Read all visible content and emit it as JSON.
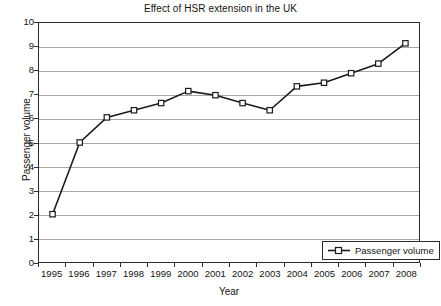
{
  "chart_data": {
    "type": "line",
    "title": "Effect of HSR extension in the UK",
    "xlabel": "Year",
    "ylabel": "Passenger volume",
    "categories": [
      "1995",
      "1996",
      "1997",
      "1998",
      "1999",
      "2000",
      "2001",
      "2002",
      "2003",
      "2004",
      "2005",
      "2006",
      "2007",
      "2008"
    ],
    "values": [
      2.0,
      5.0,
      6.05,
      6.35,
      6.65,
      7.15,
      6.98,
      6.65,
      6.35,
      7.35,
      7.5,
      7.9,
      8.3,
      9.15
    ],
    "series": [
      {
        "name": "Passenger volume",
        "values": [
          2.0,
          5.0,
          6.05,
          6.35,
          6.65,
          7.15,
          6.98,
          6.65,
          6.35,
          7.35,
          7.5,
          7.9,
          8.3,
          9.15
        ]
      }
    ],
    "ylim": [
      0,
      10
    ],
    "y_ticks": [
      0,
      1,
      2,
      3,
      4,
      5,
      6,
      7,
      8,
      9,
      10
    ],
    "y_tick_labels": [
      "0",
      "1",
      "2",
      "3",
      "4",
      "5",
      "6",
      "7",
      "8",
      "9",
      "10"
    ],
    "grid": "horizontal",
    "grid_color": "#a8a8a8",
    "legend_position": "bottom-right",
    "legend_entries": [
      "Passenger volume"
    ],
    "marker": "open-square",
    "line_color": "#1a1a1a",
    "marker_face_color": "#ffffff",
    "marker_edge_color": "#1a1a1a",
    "axis_color": "#2b2b2b",
    "background_color": "#ffffff"
  },
  "legend": {
    "label": "Passenger volume"
  }
}
